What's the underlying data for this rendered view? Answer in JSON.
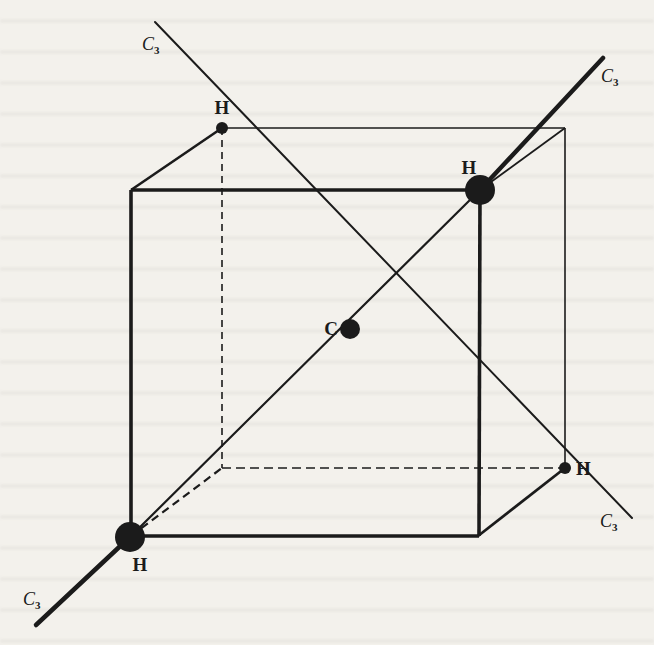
{
  "figure": {
    "colors": {
      "ink": "#1b1b1b",
      "paper": "#f3f1ec"
    },
    "atoms": {
      "carbon": {
        "label": "C",
        "x": 349,
        "y": 329
      },
      "hydrogens": [
        {
          "id": "h-back-top-left",
          "label": "H",
          "x": 222,
          "y": 128
        },
        {
          "id": "h-front-top-right",
          "label": "H",
          "x": 480,
          "y": 190
        },
        {
          "id": "h-back-bottom-right",
          "label": "H",
          "x": 565,
          "y": 468
        },
        {
          "id": "h-front-bottom-left",
          "label": "H",
          "x": 131,
          "y": 536
        }
      ]
    },
    "axes": [
      {
        "id": "c3-upper-left",
        "label": "C",
        "subscript": "3"
      },
      {
        "id": "c3-upper-right",
        "label": "C",
        "subscript": "3"
      },
      {
        "id": "c3-lower-left",
        "label": "C",
        "subscript": "3"
      },
      {
        "id": "c3-lower-right",
        "label": "C",
        "subscript": "3"
      }
    ]
  }
}
